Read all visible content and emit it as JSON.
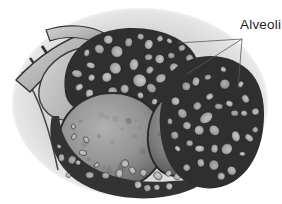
{
  "annotation": {
    "label": "Alveoli",
    "pointer_lines": [
      {
        "x1": 242,
        "y1": 39,
        "x2": 178,
        "y2": 43
      },
      {
        "x1": 242,
        "y1": 39,
        "x2": 187,
        "y2": 74
      },
      {
        "x1": 242,
        "y1": 39,
        "x2": 238,
        "y2": 88
      }
    ]
  },
  "palette": {
    "page_bg": "#ffffff",
    "vignette": "#d7d7d7",
    "ink": "#2a2a2a",
    "cluster_dark": "#2f2f2f",
    "cell_fill": "#b7b7b7",
    "sphere_mid": "#8f8f8f",
    "label_color": "#1f1f1f",
    "leader_line": "#5a5a5a"
  }
}
